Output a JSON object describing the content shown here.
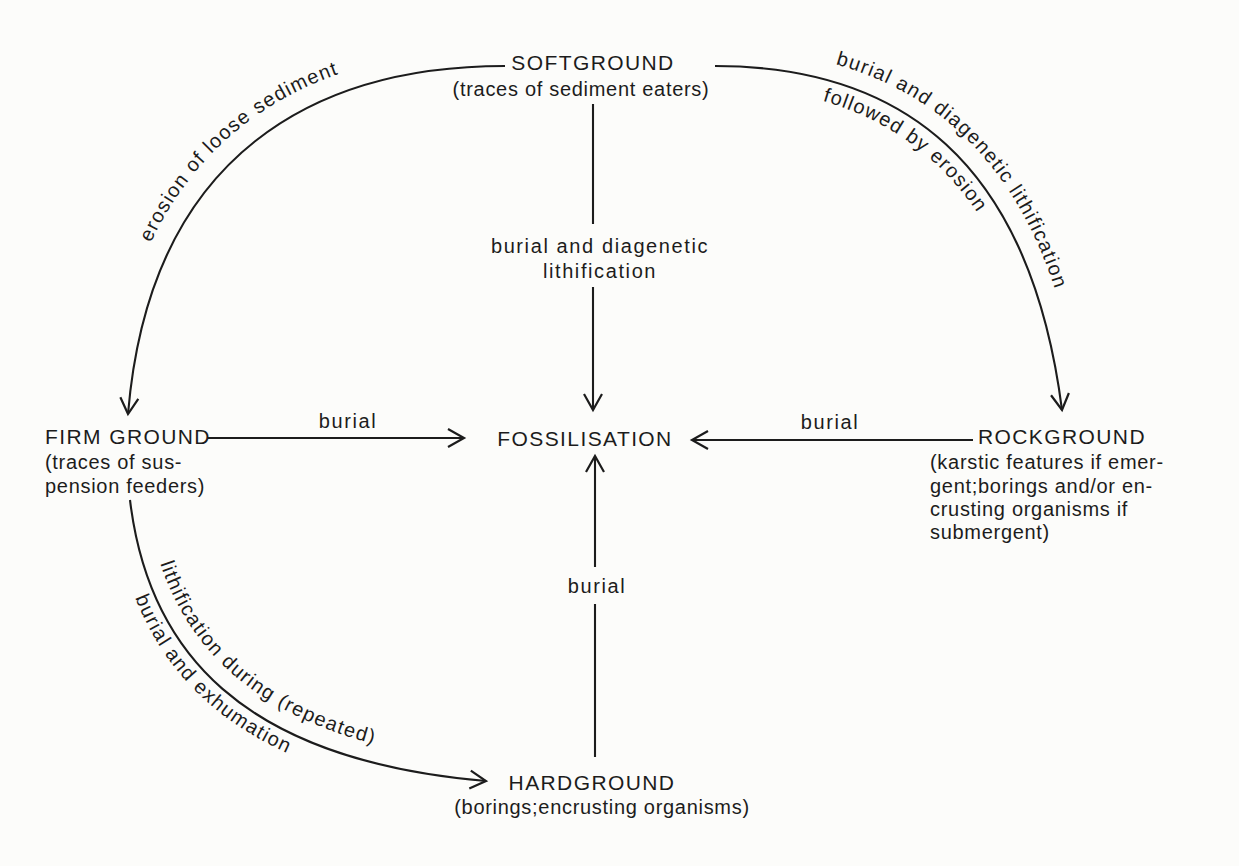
{
  "colors": {
    "background": "#fcfcfa",
    "ink": "#1c1c1c"
  },
  "nodes": {
    "softground": {
      "title": "SOFTGROUND",
      "subtitle": "(traces of sediment eaters)"
    },
    "firmground": {
      "title": "FIRM GROUND",
      "subtitle_lines": [
        "(traces of sus-",
        "pension feeders)"
      ]
    },
    "rockground": {
      "title": "ROCKGROUND",
      "subtitle_lines": [
        "(karstic features if emer-",
        "gent;borings and/or en-",
        "crusting organisms if",
        "submergent)"
      ]
    },
    "hardground": {
      "title": "HARDGROUND",
      "subtitle": "(borings;encrusting organisms)"
    },
    "fossilisation": {
      "title": "FOSSILISATION"
    }
  },
  "edges": {
    "softground_to_firmground": {
      "label": "erosion of loose sediment"
    },
    "softground_to_rockground": {
      "label_line1": "burial and diagenetic lithification",
      "label_line2": "followed by erosion"
    },
    "softground_to_fossilisation": {
      "label_line1": "burial and diagenetic",
      "label_line2": "lithification"
    },
    "firmground_to_fossilisation": {
      "label": "burial"
    },
    "rockground_to_fossilisation": {
      "label": "burial"
    },
    "hardground_to_fossilisation": {
      "label": "burial"
    },
    "firmground_to_hardground": {
      "label_line1": "lithification during (repeated)",
      "label_line2": "burial and exhumation"
    }
  }
}
